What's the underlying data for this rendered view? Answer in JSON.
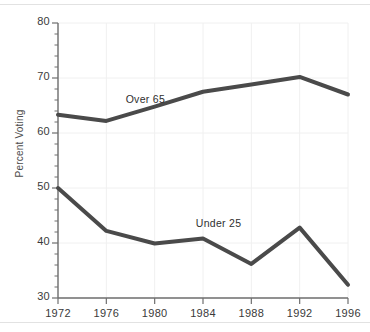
{
  "chart_data": {
    "type": "line",
    "title": "",
    "xlabel": "",
    "ylabel": "Percent Voting",
    "x": [
      1972,
      1976,
      1980,
      1984,
      1988,
      1992,
      1996
    ],
    "xtick_labels": [
      "1972",
      "1976",
      "1980",
      "1984",
      "1988",
      "1992",
      "1996"
    ],
    "ytick_labels": [
      "80",
      "70",
      "60",
      "50",
      "40",
      "30"
    ],
    "ytick_values": [
      80,
      70,
      60,
      50,
      40,
      30
    ],
    "ylim": [
      30,
      80
    ],
    "xlim": [
      1972,
      1996
    ],
    "y_minor_step": 2,
    "grid": true,
    "legend_position": "inline-annotation",
    "series": [
      {
        "name": "Over 65",
        "values": [
          63.3,
          62.2,
          64.8,
          67.5,
          68.8,
          70.2,
          67.0
        ],
        "color": "#4a4a4a"
      },
      {
        "name": "Under 25",
        "values": [
          50.0,
          42.2,
          39.9,
          40.8,
          36.2,
          42.8,
          32.4
        ],
        "color": "#4a4a4a"
      }
    ],
    "annotations": [
      {
        "text": "Over 65",
        "x": 1977.6,
        "y": 65.9
      },
      {
        "text": "Under 25",
        "x": 1983.4,
        "y": 43.2
      }
    ]
  },
  "style": {
    "line_color": "#4a4a4a",
    "axis_color": "#6f6f6f",
    "grid_color": "#f0f0f0",
    "text_color": "#3a3a3a",
    "background": "#ffffff",
    "rule_color": "#e2e2e2"
  }
}
